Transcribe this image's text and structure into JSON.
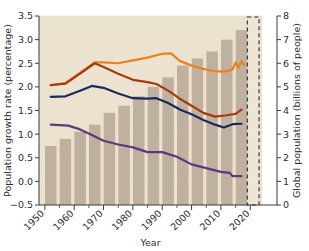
{
  "chart_data": {
    "type": "bar",
    "title": "",
    "xlabel": "Year",
    "ylabel": "Population growth rate (percentage)",
    "y2label": "Global population (billions of people)",
    "xlim": [
      1948,
      2024
    ],
    "ylim": [
      -0.5,
      3.5
    ],
    "y2lim": [
      0,
      8
    ],
    "grid": true,
    "legend": "none",
    "x_tick_labels": [
      "1950",
      "1960",
      "1970",
      "1980",
      "1990",
      "2000",
      "2010",
      "2020"
    ],
    "x_tick_values": [
      1950,
      1960,
      1970,
      1980,
      1990,
      2000,
      2010,
      2020
    ],
    "x_minor_tick_values": [
      1955,
      1965,
      1975,
      1985,
      1995,
      2005,
      2015
    ],
    "y_tick_labels": [
      "3.5",
      "3.0",
      "2.5",
      "2.0",
      "1.5",
      "1.0",
      "0.5",
      "0.0",
      "-0.5"
    ],
    "y_tick_values": [
      3.5,
      3.0,
      2.5,
      2.0,
      1.5,
      1.0,
      0.5,
      0.0,
      -0.5
    ],
    "y2_tick_labels": [
      "8",
      "7",
      "6",
      "5",
      "4",
      "3",
      "2",
      "1",
      "0"
    ],
    "y2_tick_values": [
      8,
      7,
      6,
      5,
      4,
      3,
      2,
      1,
      0
    ],
    "bars": {
      "name": "Global population",
      "axis": "right",
      "color": "#bfb0a0",
      "x": [
        1952,
        1957,
        1962,
        1967,
        1972,
        1977,
        1982,
        1987,
        1992,
        1997,
        2002,
        2007,
        2012,
        2017
      ],
      "values": [
        2.5,
        2.8,
        3.1,
        3.4,
        3.9,
        4.2,
        4.6,
        5.0,
        5.4,
        5.9,
        6.2,
        6.5,
        7.0,
        7.4
      ]
    },
    "series": [
      {
        "name": "orange-line",
        "color": "#e8821e",
        "axis": "left",
        "x": [
          1952,
          1957,
          1962,
          1967,
          1970,
          1975,
          1980,
          1985,
          1990,
          1993,
          1996,
          2000,
          2004,
          2008,
          2012,
          2014,
          2015,
          2016,
          2017,
          2018
        ],
        "values": [
          2.03,
          2.08,
          2.3,
          2.52,
          2.52,
          2.5,
          2.56,
          2.62,
          2.7,
          2.71,
          2.55,
          2.45,
          2.38,
          2.33,
          2.33,
          2.37,
          2.52,
          2.41,
          2.54,
          2.47
        ]
      },
      {
        "name": "dark-red-line",
        "color": "#a53a0e",
        "axis": "left",
        "x": [
          1952,
          1957,
          1962,
          1967,
          1970,
          1975,
          1980,
          1985,
          1988,
          1992,
          1996,
          2000,
          2004,
          2008,
          2012,
          2015,
          2017
        ],
        "values": [
          2.04,
          2.07,
          2.28,
          2.5,
          2.42,
          2.28,
          2.15,
          2.1,
          2.06,
          1.92,
          1.75,
          1.6,
          1.45,
          1.37,
          1.4,
          1.43,
          1.52
        ]
      },
      {
        "name": "navy-line",
        "color": "#1b2a5e",
        "axis": "left",
        "x": [
          1952,
          1957,
          1962,
          1966,
          1970,
          1975,
          1980,
          1985,
          1988,
          1992,
          1996,
          2000,
          2004,
          2008,
          2011,
          2014,
          2017
        ],
        "values": [
          1.79,
          1.8,
          1.92,
          2.02,
          1.98,
          1.86,
          1.76,
          1.75,
          1.76,
          1.66,
          1.52,
          1.42,
          1.3,
          1.2,
          1.14,
          1.21,
          1.22
        ]
      },
      {
        "name": "purple-line",
        "color": "#5b3a78",
        "axis": "left",
        "x": [
          1952,
          1958,
          1962,
          1966,
          1970,
          1975,
          1980,
          1985,
          1990,
          1995,
          2000,
          2005,
          2010,
          2013,
          2014,
          2017
        ],
        "values": [
          1.2,
          1.18,
          1.1,
          0.98,
          0.86,
          0.78,
          0.72,
          0.62,
          0.62,
          0.52,
          0.36,
          0.28,
          0.2,
          0.18,
          0.11,
          0.11
        ]
      }
    ],
    "projection_box": {
      "name": "projection-region",
      "x_start": 2019,
      "x_end": 2023,
      "style": "dashed"
    }
  }
}
